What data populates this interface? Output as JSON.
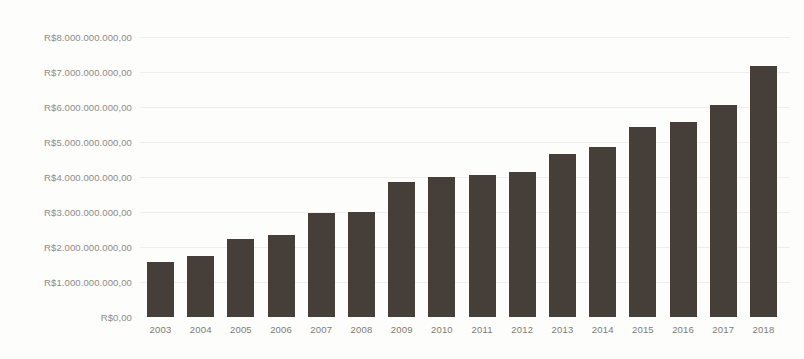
{
  "chart_data": {
    "type": "bar",
    "title": "",
    "xlabel": "",
    "ylabel": "",
    "currency_prefix": "R$",
    "categories": [
      "2003",
      "2004",
      "2005",
      "2006",
      "2007",
      "2008",
      "2009",
      "2010",
      "2011",
      "2012",
      "2013",
      "2014",
      "2015",
      "2016",
      "2017",
      "2018"
    ],
    "values": [
      1570000000,
      1740000000,
      2230000000,
      2340000000,
      2980000000,
      3000000000,
      3860000000,
      4000000000,
      4050000000,
      4130000000,
      4660000000,
      4850000000,
      5430000000,
      5560000000,
      6060000000,
      7160000000
    ],
    "ylim": [
      0,
      8000000000
    ],
    "ytick_values": [
      0,
      1000000000,
      2000000000,
      3000000000,
      4000000000,
      5000000000,
      6000000000,
      7000000000,
      8000000000
    ],
    "ytick_labels": [
      "R$0,00",
      "R$1.000.000.000,00",
      "R$2.000.000.000,00",
      "R$3.000.000.000,00",
      "R$4.000.000.000,00",
      "R$5.000.000.000,00",
      "R$6.000.000.000,00",
      "R$7.000.000.000,00",
      "R$8.000.000.000,00"
    ],
    "grid": true,
    "legend": false,
    "legend_position": "none",
    "series": [
      {
        "name": "",
        "values": [
          1570000000,
          1740000000,
          2230000000,
          2340000000,
          2980000000,
          3000000000,
          3860000000,
          4000000000,
          4050000000,
          4130000000,
          4660000000,
          4850000000,
          5430000000,
          5560000000,
          6060000000,
          7160000000
        ]
      }
    ]
  },
  "colors": {
    "bar": "#463e39",
    "gridline": "#efeeec",
    "tick_label": "#8d8a85",
    "background": "#fdfdfc"
  }
}
